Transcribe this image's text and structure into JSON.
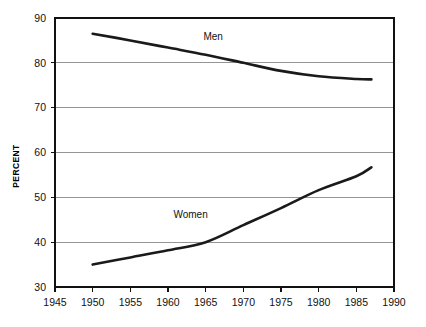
{
  "chart_data": {
    "type": "line",
    "title": "",
    "xlabel": "",
    "ylabel": "PERCENT",
    "xlim": [
      1945,
      1990
    ],
    "ylim": [
      30,
      90
    ],
    "grid": true,
    "legend_position": "inline-annotation",
    "x_ticks": [
      1945,
      1950,
      1955,
      1960,
      1965,
      1970,
      1975,
      1980,
      1985,
      1990
    ],
    "y_ticks": [
      30,
      40,
      50,
      60,
      70,
      80,
      90
    ],
    "series": [
      {
        "name": "Men",
        "label_x": 1966,
        "label_y": 85,
        "x": [
          1950,
          1955,
          1960,
          1965,
          1970,
          1975,
          1980,
          1985,
          1987
        ],
        "values": [
          86.5,
          85.0,
          83.4,
          81.8,
          80.0,
          78.2,
          77.0,
          76.4,
          76.3
        ]
      },
      {
        "name": "Women",
        "label_x": 1963,
        "label_y": 45.5,
        "x": [
          1950,
          1955,
          1960,
          1965,
          1970,
          1975,
          1980,
          1985,
          1987
        ],
        "values": [
          35.0,
          36.6,
          38.2,
          40.0,
          43.8,
          47.6,
          51.6,
          54.7,
          56.7
        ]
      }
    ]
  },
  "axis": {
    "y_title": "PERCENT",
    "y_tick_labels": [
      "30",
      "40",
      "50",
      "60",
      "70",
      "80",
      "90"
    ],
    "x_tick_labels": [
      "1945",
      "1950",
      "1955",
      "1960",
      "1965",
      "1970",
      "1975",
      "1980",
      "1985",
      "1990"
    ]
  },
  "annotations": {
    "men_label": "Men",
    "women_label": "Women"
  },
  "colors": {
    "line": "#1a1a1a",
    "gridline": "#8a8a8a",
    "frame": "#111111",
    "background": "#ffffff"
  }
}
